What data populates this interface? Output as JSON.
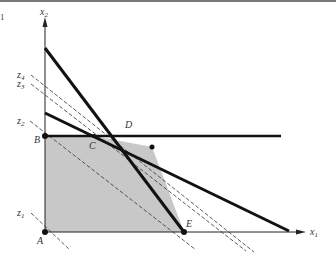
{
  "corner_mark": "1",
  "axes": {
    "x_label": "x",
    "x_sub": "1",
    "y_label": "x",
    "y_sub": "2"
  },
  "points": {
    "A": "A",
    "B": "B",
    "C": "C",
    "D": "D",
    "E": "E"
  },
  "isolines": {
    "z1": {
      "label": "z",
      "sub": "1"
    },
    "z2": {
      "label": "z",
      "sub": "2"
    },
    "z3": {
      "label": "z",
      "sub": "3"
    },
    "z4": {
      "label": "z",
      "sub": "4"
    }
  },
  "colors": {
    "feasible_fill": "#c8c8c8",
    "constraint_line": "#111111",
    "axis": "#222222",
    "dashed": "#333333"
  }
}
